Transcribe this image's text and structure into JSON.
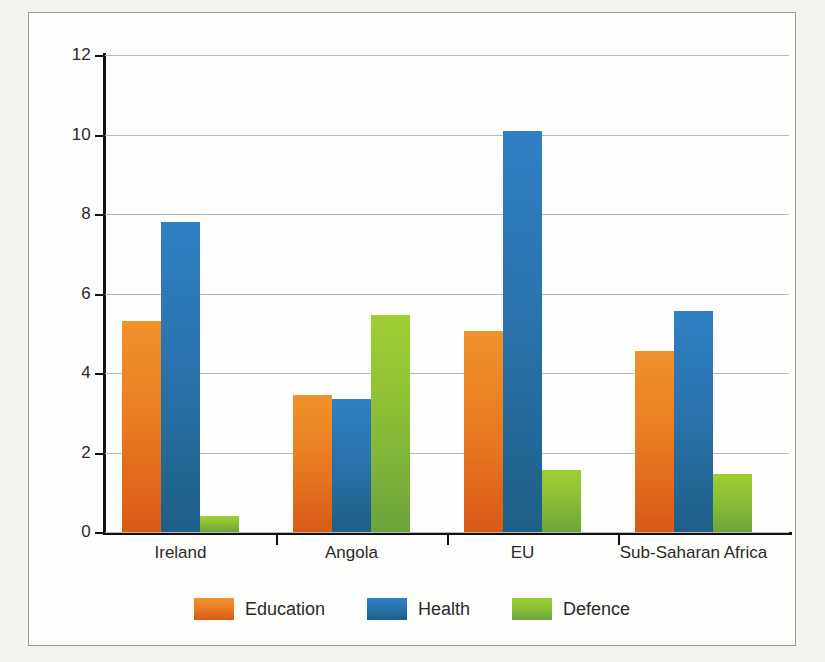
{
  "chart_data": {
    "type": "bar",
    "title": "",
    "subtitle": "",
    "xlabel": "",
    "ylabel": "",
    "categories": [
      "Ireland",
      "Angola",
      "EU",
      "Sub-Saharan Africa"
    ],
    "series": [
      {
        "name": "Education",
        "color": "#ea7d22",
        "values": [
          5.3,
          3.45,
          5.05,
          4.55
        ]
      },
      {
        "name": "Health",
        "color": "#2a73ae",
        "values": [
          7.8,
          3.35,
          10.1,
          5.55
        ]
      },
      {
        "name": "Defence",
        "color": "#8cbf35",
        "values": [
          0.4,
          5.45,
          1.55,
          1.45
        ]
      }
    ],
    "ylim": [
      0,
      12
    ],
    "yticks": [
      0,
      2,
      4,
      6,
      8,
      10,
      12
    ],
    "ytick_labels": [
      "0",
      "2",
      "4",
      "6",
      "8",
      "10",
      "12"
    ],
    "grid": true,
    "grid_axis": "y",
    "legend_position": "bottom-center",
    "annotations": []
  },
  "legend": {
    "items": [
      {
        "label": "Education",
        "swatch": "education-swatch"
      },
      {
        "label": "Health",
        "swatch": "health-swatch"
      },
      {
        "label": "Defence",
        "swatch": "defence-swatch"
      }
    ]
  },
  "colors": {
    "education": "#ea7d22",
    "health": "#2a73ae",
    "defence": "#8cbf35",
    "axis": "#111111",
    "gridline": "#b9b9b9",
    "plot_background": "#fdfdfb",
    "page_background": "#f4f2ee",
    "frame_border": "#9a9a96",
    "text": "#2a2a2a"
  }
}
